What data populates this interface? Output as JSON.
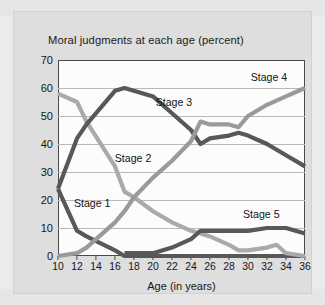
{
  "chart_data": {
    "type": "line",
    "title": "Moral judgments at each age (percent)",
    "xlabel": "Age (in years)",
    "ylabel": "",
    "xlim": [
      10,
      36
    ],
    "ylim": [
      0,
      70
    ],
    "grid": true,
    "legend_position": "inline-labels",
    "xticks": [
      10,
      12,
      14,
      16,
      18,
      20,
      22,
      24,
      26,
      28,
      30,
      32,
      34,
      36
    ],
    "yticks": [
      0,
      10,
      20,
      30,
      40,
      50,
      60,
      70
    ],
    "x": [
      10,
      12,
      13,
      16,
      17,
      18,
      20,
      22,
      24,
      25,
      26,
      28,
      29,
      30,
      32,
      33,
      34,
      36
    ],
    "series": [
      {
        "name": "Stage 1",
        "color": "#585858",
        "x": [
          10,
          12,
          13,
          16,
          17,
          36
        ],
        "values": [
          24,
          9,
          7,
          2,
          0,
          0
        ],
        "label_x": 13.6,
        "label_y": 19
      },
      {
        "name": "Stage 2",
        "color": "#aaaaaa",
        "x": [
          10,
          12,
          13,
          16,
          17,
          18,
          20,
          22,
          24,
          25,
          26,
          28,
          29,
          30,
          32,
          33,
          34,
          36
        ],
        "values": [
          58,
          55,
          48,
          32,
          23,
          21,
          16,
          12,
          9,
          8,
          7,
          4,
          2,
          2,
          3,
          4,
          1,
          0
        ],
        "label_x": 17.9,
        "label_y": 35
      },
      {
        "name": "Stage 3",
        "color": "#585858",
        "x": [
          10,
          12,
          13,
          16,
          17,
          20,
          22,
          24,
          25,
          26,
          28,
          29,
          30,
          32,
          34,
          36
        ],
        "values": [
          24,
          42,
          47,
          59,
          60,
          57,
          51,
          45,
          40,
          42,
          43,
          44,
          43,
          40,
          36,
          32
        ],
        "label_x": 22.2,
        "label_y": 55
      },
      {
        "name": "Stage 4",
        "color": "#9a9a9a",
        "x": [
          10,
          12,
          13,
          16,
          17,
          18,
          20,
          22,
          24,
          25,
          26,
          28,
          29,
          30,
          32,
          34,
          36
        ],
        "values": [
          0,
          1,
          3,
          12,
          16,
          21,
          28,
          34,
          41,
          48,
          47,
          47,
          46,
          50,
          54,
          57,
          60
        ],
        "label_x": 32.2,
        "label_y": 64
      },
      {
        "name": "Stage 5",
        "color": "#585858",
        "x": [
          17,
          18,
          20,
          22,
          24,
          25,
          26,
          28,
          30,
          32,
          33,
          34,
          36
        ],
        "values": [
          1,
          1,
          1,
          3,
          6,
          9,
          9,
          9,
          9,
          10,
          10,
          10,
          8
        ],
        "label_x": 31.4,
        "label_y": 15
      }
    ]
  }
}
